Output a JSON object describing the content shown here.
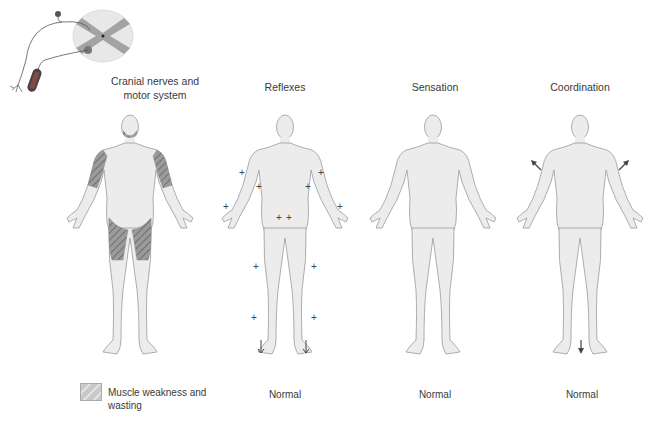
{
  "neuron_diagram": {
    "label": "spinal-cord-neuron"
  },
  "panels": [
    {
      "id": "motor",
      "title": "Cranial nerves and motor system",
      "title_lines": [
        "Cranial nerves and",
        "motor system"
      ],
      "status": ""
    },
    {
      "id": "reflexes",
      "title": "Reflexes",
      "status": "Normal"
    },
    {
      "id": "sensation",
      "title": "Sensation",
      "status": "Normal"
    },
    {
      "id": "coordination",
      "title": "Coordination",
      "status": "Normal"
    }
  ],
  "legend": {
    "label_line1": "Muscle weakness and",
    "label_line2": "wasting",
    "hatch_color": "#8a8a8a"
  },
  "reflex_markers": "+",
  "colors": {
    "body_fill": "#ececec",
    "body_stroke": "#9a9a9a",
    "hatch": "#7d7d7d",
    "arrow": "#444444"
  }
}
